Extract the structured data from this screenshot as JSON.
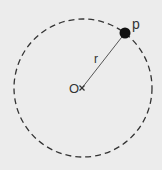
{
  "diagram": {
    "background": "#ececec",
    "stroke_color": "#333333",
    "radius_line_color": "#555555",
    "circle": {
      "cx": 83,
      "cy": 88,
      "r": 69,
      "dash": "6 4"
    },
    "center": {
      "x": 82,
      "y": 88,
      "label": "O"
    },
    "point": {
      "x": 125,
      "y": 33,
      "r": 5,
      "label": "p"
    },
    "radius_label": "r"
  }
}
